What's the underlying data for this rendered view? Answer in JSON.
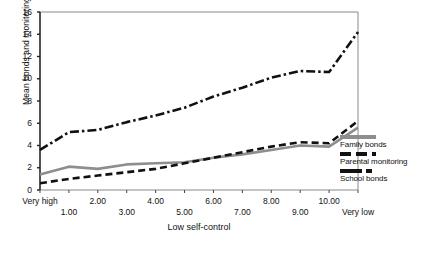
{
  "chart_data": {
    "type": "line",
    "title": "",
    "xlabel": "Low self-control",
    "ylabel": "Mean bonds and monitoring",
    "ylim": [
      0,
      16
    ],
    "yticks": [
      0,
      2,
      4,
      6,
      8,
      10,
      12,
      14,
      16
    ],
    "grid": false,
    "legend_position": "right",
    "categories": [
      "Very high",
      "1.00",
      "2.00",
      "3.00",
      "4.00",
      "5.00",
      "6.00",
      "7.00",
      "8.00",
      "9.00",
      "10.00",
      "Very low"
    ],
    "series": [
      {
        "name": "Family bonds",
        "style": "solid",
        "color": "#8e8e8e",
        "values": [
          1.4,
          2.1,
          1.9,
          2.3,
          2.4,
          2.5,
          2.9,
          3.2,
          3.6,
          4.0,
          3.9,
          5.6
        ]
      },
      {
        "name": "Parental monitoring",
        "style": "dashed",
        "color": "#111111",
        "values": [
          0.6,
          1.0,
          1.3,
          1.6,
          1.9,
          2.4,
          2.9,
          3.4,
          3.9,
          4.3,
          4.2,
          6.2
        ]
      },
      {
        "name": "School bonds",
        "style": "dash-dot",
        "color": "#111111",
        "values": [
          3.6,
          5.2,
          5.4,
          6.1,
          6.7,
          7.4,
          8.4,
          9.2,
          10.1,
          10.7,
          10.6,
          14.2
        ]
      }
    ]
  },
  "legend": {
    "items": [
      {
        "label": "Family bonds",
        "key": "solid-gray-line-key"
      },
      {
        "label": "Parental monitoring",
        "key": "dashed-black-line-key"
      },
      {
        "label": "School bonds",
        "key": "dash-dot-black-line-key"
      }
    ]
  },
  "caption": {
    "text": ""
  }
}
